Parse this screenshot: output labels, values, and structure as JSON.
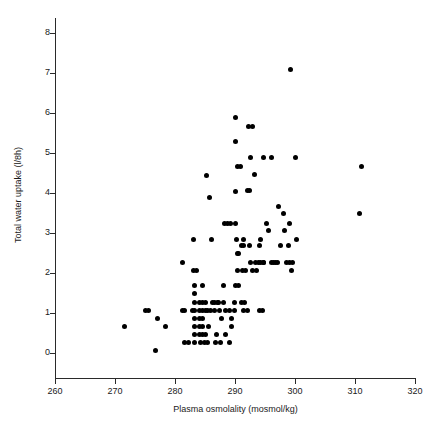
{
  "chart_data": {
    "type": "scatter",
    "title": "",
    "xlabel": "Plasma osmolality (mosmol/kg)",
    "ylabel": "Total water uptake (l/8h)",
    "xlim": [
      260,
      320
    ],
    "ylim": [
      -0.3,
      8.4
    ],
    "xticks": [
      260,
      270,
      280,
      290,
      300,
      310,
      320
    ],
    "xtick_labels": [
      "260",
      "270",
      "280",
      "290",
      "300",
      "310",
      "320"
    ],
    "yticks": [
      0,
      1,
      2,
      3,
      4,
      5,
      6,
      7,
      8
    ],
    "ytick_labels": [
      "0",
      "1",
      "2",
      "3",
      "4",
      "5",
      "6",
      "7",
      "8"
    ],
    "grid": false,
    "legend": null,
    "marker": {
      "shape": "circle",
      "color": "#000000",
      "size": 5
    },
    "n_points": 131,
    "points": [
      [
        271.6,
        0.67
      ],
      [
        275.0,
        1.07
      ],
      [
        275.6,
        1.07
      ],
      [
        276.7,
        0.06
      ],
      [
        277.0,
        0.87
      ],
      [
        278.4,
        0.67
      ],
      [
        281.2,
        1.07
      ],
      [
        281.6,
        1.07
      ],
      [
        281.3,
        2.26
      ],
      [
        281.5,
        0.27
      ],
      [
        282.2,
        0.27
      ],
      [
        283.0,
        2.85
      ],
      [
        283.1,
        2.07
      ],
      [
        283.6,
        2.07
      ],
      [
        283.2,
        1.69
      ],
      [
        283.3,
        1.48
      ],
      [
        283.3,
        1.27
      ],
      [
        283.2,
        1.07
      ],
      [
        283.3,
        0.87
      ],
      [
        283.2,
        0.67
      ],
      [
        283.3,
        0.47
      ],
      [
        283.3,
        0.27
      ],
      [
        284.1,
        1.27
      ],
      [
        284.6,
        1.27
      ],
      [
        285.0,
        1.27
      ],
      [
        284.1,
        1.07
      ],
      [
        284.6,
        1.07
      ],
      [
        285.0,
        1.07
      ],
      [
        284.1,
        0.87
      ],
      [
        284.6,
        0.87
      ],
      [
        284.1,
        0.67
      ],
      [
        284.6,
        0.67
      ],
      [
        284.1,
        0.47
      ],
      [
        284.6,
        0.47
      ],
      [
        284.3,
        0.27
      ],
      [
        284.9,
        0.27
      ],
      [
        285.0,
        0.47
      ],
      [
        285.4,
        0.27
      ],
      [
        285.2,
        4.45
      ],
      [
        286.0,
        2.85
      ],
      [
        285.8,
        3.88
      ],
      [
        286.3,
        1.27
      ],
      [
        286.6,
        1.27
      ],
      [
        287.0,
        1.27
      ],
      [
        287.3,
        1.27
      ],
      [
        287.4,
        1.07
      ],
      [
        287.6,
        0.27
      ],
      [
        288.0,
        1.27
      ],
      [
        288.4,
        1.07
      ],
      [
        288.0,
        1.69
      ],
      [
        288.3,
        3.25
      ],
      [
        288.8,
        3.25
      ],
      [
        289.2,
        3.25
      ],
      [
        289.1,
        1.07
      ],
      [
        289.4,
        0.87
      ],
      [
        289.4,
        0.67
      ],
      [
        289.9,
        1.07
      ],
      [
        290.0,
        5.88
      ],
      [
        290.0,
        5.28
      ],
      [
        290.0,
        4.05
      ],
      [
        290.1,
        3.25
      ],
      [
        290.3,
        2.85
      ],
      [
        290.4,
        2.48
      ],
      [
        290.5,
        2.48
      ],
      [
        290.4,
        2.07
      ],
      [
        290.0,
        1.69
      ],
      [
        290.4,
        4.67
      ],
      [
        290.9,
        4.67
      ],
      [
        291.0,
        2.68
      ],
      [
        291.4,
        2.68
      ],
      [
        291.4,
        2.85
      ],
      [
        291.2,
        2.07
      ],
      [
        291.4,
        1.07
      ],
      [
        291.6,
        1.27
      ],
      [
        292.0,
        4.07
      ],
      [
        292.4,
        4.07
      ],
      [
        292.3,
        5.67
      ],
      [
        292.9,
        5.67
      ],
      [
        292.6,
        4.88
      ],
      [
        292.4,
        2.68
      ],
      [
        292.5,
        2.26
      ],
      [
        292.9,
        2.07
      ],
      [
        293.3,
        4.47
      ],
      [
        293.4,
        2.26
      ],
      [
        293.9,
        2.26
      ],
      [
        294.3,
        2.26
      ],
      [
        294.8,
        2.26
      ],
      [
        294.0,
        2.68
      ],
      [
        294.2,
        2.85
      ],
      [
        294.0,
        1.07
      ],
      [
        294.6,
        1.07
      ],
      [
        294.8,
        4.88
      ],
      [
        295.3,
        3.25
      ],
      [
        295.6,
        3.07
      ],
      [
        296.0,
        4.88
      ],
      [
        296.0,
        2.26
      ],
      [
        296.4,
        2.26
      ],
      [
        296.8,
        2.26
      ],
      [
        297.0,
        2.26
      ],
      [
        297.3,
        3.67
      ],
      [
        297.6,
        2.68
      ],
      [
        298.0,
        3.48
      ],
      [
        298.2,
        3.07
      ],
      [
        298.6,
        2.26
      ],
      [
        299.1,
        2.26
      ],
      [
        299.5,
        2.26
      ],
      [
        299.1,
        3.25
      ],
      [
        299.3,
        7.09
      ],
      [
        299.4,
        2.07
      ],
      [
        300.0,
        4.88
      ],
      [
        300.3,
        2.85
      ],
      [
        310.8,
        3.49
      ],
      [
        311.0,
        4.67
      ],
      [
        286.8,
        0.27
      ],
      [
        286.9,
        0.47
      ],
      [
        285.6,
        0.67
      ],
      [
        287.8,
        0.87
      ],
      [
        289.0,
        0.27
      ],
      [
        288.4,
        0.47
      ],
      [
        282.9,
        1.07
      ],
      [
        285.4,
        1.07
      ],
      [
        285.9,
        1.07
      ],
      [
        286.5,
        1.07
      ],
      [
        289.9,
        1.27
      ],
      [
        291.0,
        1.27
      ],
      [
        292.0,
        1.07
      ],
      [
        284.5,
        1.69
      ],
      [
        290.5,
        1.69
      ],
      [
        291.7,
        2.07
      ],
      [
        293.6,
        2.07
      ],
      [
        294.7,
        2.26
      ],
      [
        298.9,
        2.68
      ]
    ]
  }
}
